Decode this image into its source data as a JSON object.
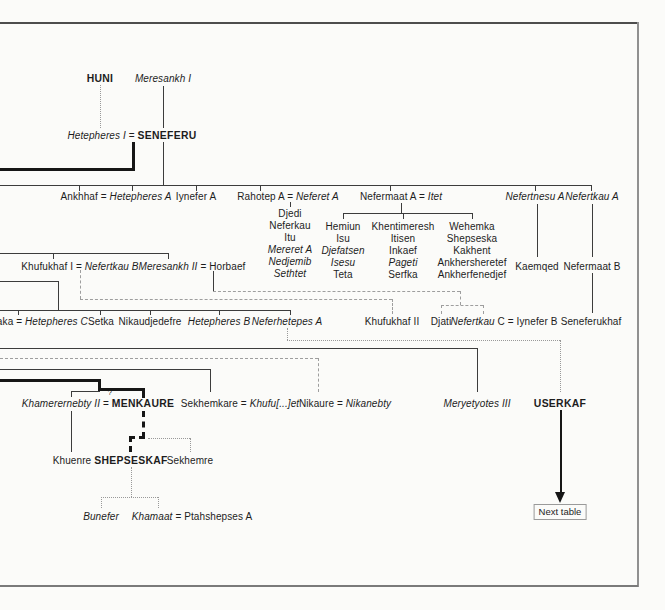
{
  "palette": {
    "line": "#3c3c3c",
    "thick": "#161616",
    "dash": "#9e9e9e",
    "dot": "#999999",
    "text": "#1d1d1d",
    "frame_dark": "#4d4d4d",
    "frame_mid": "#7a7a7a",
    "frame_light": "#909090",
    "background": "#fbfbf9"
  },
  "next_table": {
    "label": "Next table"
  },
  "nodes": [
    {
      "name": "person-huni",
      "x": 100,
      "y": 73,
      "segments": [
        {
          "text": "HUNI",
          "bold": true
        }
      ]
    },
    {
      "name": "person-meresankh-i",
      "x": 163,
      "y": 73,
      "segments": [
        {
          "text": "Meresankh I",
          "italic": true
        }
      ]
    },
    {
      "name": "person-hetepheres-i-seneferu",
      "x": 132,
      "y": 130,
      "segments": [
        {
          "text": "Hetepheres I ",
          "italic": true
        },
        {
          "text": "= "
        },
        {
          "text": "SENEFERU",
          "bold": true
        }
      ]
    },
    {
      "name": "person-ankhhaf-hetepheres-a",
      "x": 116,
      "y": 191,
      "segments": [
        {
          "text": "Ankhhaf = "
        },
        {
          "text": "Hetepheres A",
          "italic": true
        }
      ]
    },
    {
      "name": "person-iynefer-a",
      "x": 196,
      "y": 191,
      "segments": [
        {
          "text": "Iynefer A"
        }
      ]
    },
    {
      "name": "person-rahotep-a-neferet-a",
      "x": 288,
      "y": 191,
      "segments": [
        {
          "text": "Rahotep A = "
        },
        {
          "text": "Neferet A",
          "italic": true
        }
      ]
    },
    {
      "name": "person-nefermaat-a-itet",
      "x": 401,
      "y": 191,
      "segments": [
        {
          "text": "Nefermaat A = "
        },
        {
          "text": "Itet",
          "italic": true
        }
      ]
    },
    {
      "name": "person-nefertnesu-a",
      "x": 535,
      "y": 191,
      "segments": [
        {
          "text": "Nefertnesu A",
          "italic": true
        }
      ]
    },
    {
      "name": "person-nefertkau-a",
      "x": 592,
      "y": 191,
      "segments": [
        {
          "text": "Nefertkau A",
          "italic": true
        }
      ]
    },
    {
      "name": "person-djedi",
      "x": 290,
      "y": 208,
      "segments": [
        {
          "text": "Djedi"
        }
      ]
    },
    {
      "name": "person-neferkau",
      "x": 290,
      "y": 220,
      "segments": [
        {
          "text": "Neferkau"
        }
      ]
    },
    {
      "name": "person-itu",
      "x": 290,
      "y": 232,
      "segments": [
        {
          "text": "Itu"
        }
      ]
    },
    {
      "name": "person-mereret-a",
      "x": 290,
      "y": 244,
      "segments": [
        {
          "text": "Mereret A",
          "italic": true
        }
      ]
    },
    {
      "name": "person-nedjemib",
      "x": 290,
      "y": 256,
      "segments": [
        {
          "text": "Nedjemib",
          "italic": true
        }
      ]
    },
    {
      "name": "person-sethtet",
      "x": 290,
      "y": 268,
      "segments": [
        {
          "text": "Sethtet",
          "italic": true
        }
      ]
    },
    {
      "name": "person-hemiun",
      "x": 343,
      "y": 221,
      "segments": [
        {
          "text": "Hemiun"
        }
      ]
    },
    {
      "name": "person-isu",
      "x": 343,
      "y": 233,
      "segments": [
        {
          "text": "Isu"
        }
      ]
    },
    {
      "name": "person-djefatsen",
      "x": 343,
      "y": 245,
      "segments": [
        {
          "text": "Djefatsen",
          "italic": true
        }
      ]
    },
    {
      "name": "person-isesu",
      "x": 343,
      "y": 257,
      "segments": [
        {
          "text": "Isesu",
          "italic": true
        }
      ]
    },
    {
      "name": "person-teta",
      "x": 343,
      "y": 269,
      "segments": [
        {
          "text": "Teta"
        }
      ]
    },
    {
      "name": "person-khentimeresh",
      "x": 403,
      "y": 221,
      "segments": [
        {
          "text": "Khentimeresh"
        }
      ]
    },
    {
      "name": "person-itisen",
      "x": 403,
      "y": 233,
      "segments": [
        {
          "text": "Itisen"
        }
      ]
    },
    {
      "name": "person-inkaef",
      "x": 403,
      "y": 245,
      "segments": [
        {
          "text": "Inkaef"
        }
      ]
    },
    {
      "name": "person-pageti",
      "x": 403,
      "y": 257,
      "segments": [
        {
          "text": "Pageti",
          "italic": true
        }
      ]
    },
    {
      "name": "person-serfka",
      "x": 403,
      "y": 269,
      "segments": [
        {
          "text": "Serfka"
        }
      ]
    },
    {
      "name": "person-wehemka",
      "x": 472,
      "y": 221,
      "segments": [
        {
          "text": "Wehemka"
        }
      ]
    },
    {
      "name": "person-shepseska",
      "x": 472,
      "y": 233,
      "segments": [
        {
          "text": "Shepseska"
        }
      ]
    },
    {
      "name": "person-kakhent",
      "x": 472,
      "y": 245,
      "segments": [
        {
          "text": "Kakhent"
        }
      ]
    },
    {
      "name": "person-ankhersheretef",
      "x": 472,
      "y": 257,
      "segments": [
        {
          "text": "Ankhersheretef"
        }
      ]
    },
    {
      "name": "person-ankherfenedjef",
      "x": 472,
      "y": 269,
      "segments": [
        {
          "text": "Ankherfenedjef"
        }
      ]
    },
    {
      "name": "person-khufukhaf-i-nefertkau-b",
      "x": 80,
      "y": 261,
      "segments": [
        {
          "text": "Khufukhaf I = "
        },
        {
          "text": "Nefertkau B",
          "italic": true
        }
      ]
    },
    {
      "name": "person-meresankh-ii-horbaef",
      "x": 192,
      "y": 261,
      "segments": [
        {
          "text": "Meresankh II ",
          "italic": true
        },
        {
          "text": "= Horbaef"
        }
      ]
    },
    {
      "name": "person-kaemqed",
      "x": 537,
      "y": 261,
      "segments": [
        {
          "text": "Kaemqed"
        }
      ]
    },
    {
      "name": "person-nefermaat-b",
      "x": 592,
      "y": 261,
      "segments": [
        {
          "text": "Nefermaat B"
        }
      ]
    },
    {
      "name": "person-baka-hetepheres-c",
      "x": 39,
      "y": 316,
      "segments": [
        {
          "text": "Baka = "
        },
        {
          "text": "Hetepheres C",
          "italic": true
        }
      ]
    },
    {
      "name": "person-setka",
      "x": 101,
      "y": 316,
      "segments": [
        {
          "text": "Setka"
        }
      ]
    },
    {
      "name": "person-nikaudjedefre",
      "x": 150,
      "y": 316,
      "segments": [
        {
          "text": "Nikaudjedefre"
        }
      ]
    },
    {
      "name": "person-hetepheres-b",
      "x": 219,
      "y": 316,
      "segments": [
        {
          "text": "Hetepheres B",
          "italic": true
        }
      ]
    },
    {
      "name": "person-neferhetepes-a",
      "x": 287,
      "y": 316,
      "segments": [
        {
          "text": "Neferhetepes A",
          "italic": true
        }
      ]
    },
    {
      "name": "person-khufukhaf-ii",
      "x": 392,
      "y": 316,
      "segments": [
        {
          "text": "Khufukhaf II"
        }
      ]
    },
    {
      "name": "person-djati",
      "x": 441,
      "y": 316,
      "segments": [
        {
          "text": "Djati"
        }
      ]
    },
    {
      "name": "person-nefertkau-c-iynefer-b",
      "x": 504,
      "y": 316,
      "segments": [
        {
          "text": "Nefertkau ",
          "italic": true
        },
        {
          "text": "C = Iynefer B"
        }
      ]
    },
    {
      "name": "person-seneferukhaf",
      "x": 591,
      "y": 316,
      "segments": [
        {
          "text": "Seneferukhaf"
        }
      ]
    },
    {
      "name": "person-khamerernebty-ii-menkaure",
      "x": 98,
      "y": 398,
      "segments": [
        {
          "text": "Khamerernebty II ",
          "italic": true
        },
        {
          "text": "= "
        },
        {
          "text": "MENKAURE",
          "bold": true
        }
      ]
    },
    {
      "name": "uncertain-marriage-mark",
      "x": 110,
      "y": 387,
      "small": true,
      "segments": [
        {
          "text": "?"
        }
      ]
    },
    {
      "name": "person-sekhemkare-khufuet",
      "x": 240,
      "y": 398,
      "segments": [
        {
          "text": "Sekhemkare = "
        },
        {
          "text": "Khufu[...]et",
          "italic": true
        }
      ]
    },
    {
      "name": "person-nikaure-nikanebty",
      "x": 345,
      "y": 398,
      "segments": [
        {
          "text": "Nikaure = "
        },
        {
          "text": "Nikanebty",
          "italic": true
        }
      ]
    },
    {
      "name": "person-meryetyotes-iii",
      "x": 477,
      "y": 398,
      "segments": [
        {
          "text": "Meryetyotes III",
          "italic": true
        }
      ]
    },
    {
      "name": "person-userkaf",
      "x": 560,
      "y": 398,
      "segments": [
        {
          "text": "USERKAF",
          "bold": true
        }
      ]
    },
    {
      "name": "person-khuenre",
      "x": 72,
      "y": 455,
      "segments": [
        {
          "text": "Khuenre"
        }
      ]
    },
    {
      "name": "person-shepseskaf",
      "x": 131,
      "y": 455,
      "segments": [
        {
          "text": "SHEPSESKAF",
          "bold": true
        }
      ]
    },
    {
      "name": "person-sekhemre",
      "x": 190,
      "y": 455,
      "segments": [
        {
          "text": "Sekhemre"
        }
      ]
    },
    {
      "name": "person-bunefer",
      "x": 101,
      "y": 511,
      "segments": [
        {
          "text": "Bunefer",
          "italic": true
        }
      ]
    },
    {
      "name": "person-khamaat-ptahshepses-a",
      "x": 192,
      "y": 511,
      "segments": [
        {
          "text": "Khamaat ",
          "italic": true
        },
        {
          "text": "= Ptahshepses A"
        }
      ]
    }
  ],
  "connectors": [
    {
      "d": "h",
      "x": 0,
      "y": 22,
      "l": 639,
      "s": "frame",
      "th": 2,
      "c": "#4d4d4d"
    },
    {
      "d": "v",
      "x": 637,
      "y": 22,
      "l": 565,
      "s": "frame",
      "th": 1.5,
      "c": "#909090"
    },
    {
      "d": "h",
      "x": 0,
      "y": 585,
      "l": 638,
      "s": "frame",
      "th": 2,
      "c": "#7a7a7a"
    },
    {
      "d": "v",
      "x": 100,
      "y": 85,
      "l": 43,
      "s": "dot"
    },
    {
      "d": "v",
      "x": 163,
      "y": 86,
      "l": 42,
      "s": "solid"
    },
    {
      "d": "v",
      "x": 163,
      "y": 142,
      "l": 43,
      "s": "solid"
    },
    {
      "d": "v",
      "x": 132,
      "y": 142,
      "l": 29,
      "s": "thick"
    },
    {
      "d": "h",
      "x": 0,
      "y": 168,
      "l": 135,
      "s": "thick"
    },
    {
      "d": "h",
      "x": 0,
      "y": 185,
      "l": 591,
      "s": "solid"
    },
    {
      "d": "v",
      "x": 79,
      "y": 185,
      "l": 6,
      "s": "solid"
    },
    {
      "d": "v",
      "x": 132,
      "y": 185,
      "l": 6,
      "s": "solid"
    },
    {
      "d": "v",
      "x": 196,
      "y": 185,
      "l": 6,
      "s": "solid"
    },
    {
      "d": "v",
      "x": 260,
      "y": 185,
      "l": 6,
      "s": "solid"
    },
    {
      "d": "v",
      "x": 390,
      "y": 185,
      "l": 6,
      "s": "solid"
    },
    {
      "d": "v",
      "x": 535,
      "y": 185,
      "l": 6,
      "s": "solid"
    },
    {
      "d": "v",
      "x": 591,
      "y": 185,
      "l": 6,
      "s": "solid"
    },
    {
      "d": "v",
      "x": 290,
      "y": 202,
      "l": 5,
      "s": "solid"
    },
    {
      "d": "v",
      "x": 401,
      "y": 203,
      "l": 10,
      "s": "solid"
    },
    {
      "d": "h",
      "x": 343,
      "y": 213,
      "l": 129,
      "s": "solid"
    },
    {
      "d": "v",
      "x": 343,
      "y": 213,
      "l": 6,
      "s": "solid"
    },
    {
      "d": "v",
      "x": 403,
      "y": 213,
      "l": 6,
      "s": "solid"
    },
    {
      "d": "v",
      "x": 472,
      "y": 213,
      "l": 6,
      "s": "solid"
    },
    {
      "d": "v",
      "x": 537,
      "y": 204,
      "l": 53,
      "s": "solid"
    },
    {
      "d": "v",
      "x": 592,
      "y": 204,
      "l": 53,
      "s": "solid"
    },
    {
      "d": "v",
      "x": 592,
      "y": 273,
      "l": 40,
      "s": "solid"
    },
    {
      "d": "h",
      "x": 0,
      "y": 253,
      "l": 168,
      "s": "solid"
    },
    {
      "d": "v",
      "x": 53,
      "y": 253,
      "l": 6,
      "s": "solid"
    },
    {
      "d": "v",
      "x": 168,
      "y": 253,
      "l": 6,
      "s": "solid"
    },
    {
      "d": "h",
      "x": 0,
      "y": 281,
      "l": 58,
      "s": "solid"
    },
    {
      "d": "v",
      "x": 58,
      "y": 281,
      "l": 29,
      "s": "solid"
    },
    {
      "d": "h",
      "x": 0,
      "y": 310,
      "l": 290,
      "s": "solid"
    },
    {
      "d": "v",
      "x": 18,
      "y": 310,
      "l": 5,
      "s": "solid"
    },
    {
      "d": "v",
      "x": 100,
      "y": 310,
      "l": 5,
      "s": "solid"
    },
    {
      "d": "v",
      "x": 150,
      "y": 310,
      "l": 5,
      "s": "solid"
    },
    {
      "d": "v",
      "x": 219,
      "y": 310,
      "l": 5,
      "s": "solid"
    },
    {
      "d": "v",
      "x": 290,
      "y": 310,
      "l": 5,
      "s": "solid"
    },
    {
      "d": "v",
      "x": 213,
      "y": 271,
      "l": 20,
      "s": "solid"
    },
    {
      "d": "h",
      "x": 213,
      "y": 291,
      "l": 247,
      "s": "dash"
    },
    {
      "d": "v",
      "x": 460,
      "y": 291,
      "l": 14,
      "s": "dash"
    },
    {
      "d": "h",
      "x": 441,
      "y": 305,
      "l": 42,
      "s": "dash"
    },
    {
      "d": "v",
      "x": 441,
      "y": 305,
      "l": 9,
      "s": "dash"
    },
    {
      "d": "v",
      "x": 483,
      "y": 305,
      "l": 9,
      "s": "dash"
    },
    {
      "d": "v",
      "x": 80,
      "y": 270,
      "l": 29,
      "s": "dash"
    },
    {
      "d": "h",
      "x": 80,
      "y": 299,
      "l": 312,
      "s": "dash"
    },
    {
      "d": "v",
      "x": 392,
      "y": 299,
      "l": 15,
      "s": "dash"
    },
    {
      "d": "v",
      "x": 287,
      "y": 328,
      "l": 12,
      "s": "dot"
    },
    {
      "d": "h",
      "x": 287,
      "y": 340,
      "l": 273,
      "s": "dot"
    },
    {
      "d": "v",
      "x": 560,
      "y": 340,
      "l": 52,
      "s": "dot"
    },
    {
      "d": "h",
      "x": 0,
      "y": 348,
      "l": 477,
      "s": "solid"
    },
    {
      "d": "v",
      "x": 477,
      "y": 348,
      "l": 44,
      "s": "solid"
    },
    {
      "d": "h",
      "x": 0,
      "y": 358,
      "l": 318,
      "s": "dash"
    },
    {
      "d": "v",
      "x": 318,
      "y": 358,
      "l": 34,
      "s": "dash"
    },
    {
      "d": "h",
      "x": 0,
      "y": 369,
      "l": 210,
      "s": "solid"
    },
    {
      "d": "v",
      "x": 210,
      "y": 369,
      "l": 23,
      "s": "solid"
    },
    {
      "d": "h",
      "x": 0,
      "y": 379,
      "l": 101,
      "s": "thick"
    },
    {
      "d": "v",
      "x": 98,
      "y": 379,
      "l": 12,
      "s": "thick"
    },
    {
      "d": "h",
      "x": 98,
      "y": 388,
      "l": 47,
      "s": "thick"
    },
    {
      "d": "v",
      "x": 142,
      "y": 388,
      "l": 10,
      "s": "thick"
    },
    {
      "d": "h",
      "x": 71,
      "y": 391,
      "l": 29,
      "s": "solid"
    },
    {
      "d": "v",
      "x": 71,
      "y": 391,
      "l": 6,
      "s": "solid"
    },
    {
      "d": "v",
      "x": 71,
      "y": 411,
      "l": 41,
      "s": "solid"
    },
    {
      "d": "v",
      "x": 142,
      "y": 411,
      "l": 27,
      "s": "tdash"
    },
    {
      "d": "h",
      "x": 129,
      "y": 436,
      "l": 16,
      "s": "tdash"
    },
    {
      "d": "v",
      "x": 129,
      "y": 436,
      "l": 16,
      "s": "tdash"
    },
    {
      "d": "h",
      "x": 148,
      "y": 438,
      "l": 42,
      "s": "dot"
    },
    {
      "d": "v",
      "x": 190,
      "y": 438,
      "l": 14,
      "s": "dot"
    },
    {
      "d": "v",
      "x": 131,
      "y": 467,
      "l": 30,
      "s": "dot"
    },
    {
      "d": "h",
      "x": 101,
      "y": 497,
      "l": 57,
      "s": "dot"
    },
    {
      "d": "v",
      "x": 101,
      "y": 497,
      "l": 11,
      "s": "dot"
    },
    {
      "d": "v",
      "x": 158,
      "y": 497,
      "l": 11,
      "s": "dot"
    },
    {
      "d": "v",
      "x": 560,
      "y": 410,
      "l": 84,
      "s": "arrow"
    }
  ]
}
